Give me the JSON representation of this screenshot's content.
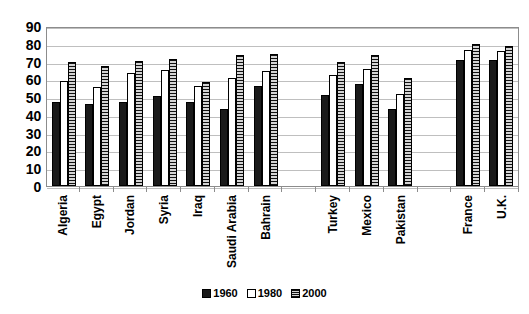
{
  "chart_data": {
    "type": "bar",
    "title": "",
    "subtitle": "",
    "xlabel": "",
    "ylabel": "",
    "ylim": [
      0,
      90
    ],
    "ytick_step": 10,
    "yticks": [
      90,
      80,
      70,
      60,
      50,
      40,
      30,
      20,
      10,
      0
    ],
    "grid": true,
    "legend_position": "bottom",
    "categories": [
      "Algeria",
      "Egypt",
      "Jordan",
      "Syria",
      "Iraq",
      "Saudi Arabia",
      "Bahrain",
      "",
      "Turkey",
      "Mexico",
      "Pakistan",
      "",
      "France",
      "U.K."
    ],
    "series": [
      {
        "name": "1960",
        "color": "#1a1a1a",
        "fill": "solid-black",
        "values": [
          47,
          46,
          47,
          50.5,
          47.5,
          43.5,
          56.5,
          null,
          51,
          57.5,
          43.5,
          null,
          71,
          71
        ]
      },
      {
        "name": "1980",
        "color": "#ffffff",
        "fill": "white-outline",
        "values": [
          59,
          55.5,
          63.5,
          65.5,
          56.5,
          60.5,
          64.5,
          null,
          62.5,
          66,
          52,
          null,
          76.5,
          76
        ]
      },
      {
        "name": "2000",
        "color": "#9e9e9e",
        "fill": "gray-horizontal-stripes",
        "values": [
          70,
          67.5,
          70.5,
          71.5,
          58.5,
          73.5,
          74.5,
          null,
          69.5,
          73.5,
          60.5,
          null,
          80,
          79
        ]
      }
    ]
  },
  "legend": {
    "items": [
      {
        "label": "1960",
        "swatch": "s1960"
      },
      {
        "label": "1980",
        "swatch": "s1980"
      },
      {
        "label": "2000",
        "swatch": "s2000"
      }
    ]
  }
}
